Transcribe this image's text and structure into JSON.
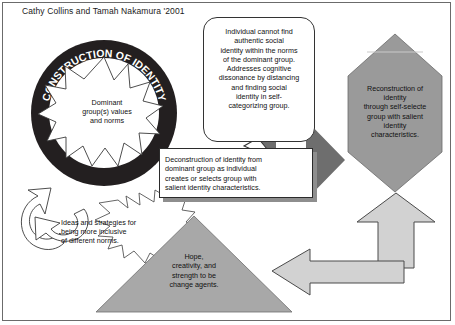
{
  "diagram": {
    "title": "Cathy Collins and Tamah Nakamura '2001",
    "ring_label": "CONSTRUCTION OF IDENTITY",
    "starburst": {
      "line1": "Dominant",
      "line2": "group(s) values",
      "line3": "and norms"
    },
    "callout": {
      "text": "Individual cannot find authentic social identity within the norms of the dominant group. Addresses cognitive dissonance by distancing and finding social identity in self-categorizing group.",
      "lines": [
        "Individual cannot find",
        "authentic social",
        "identity within the norms",
        "of the dominant group.",
        "Addresses cognitive",
        "dissonance by distancing",
        "and finding social",
        "identity in self-",
        "categorizing group."
      ]
    },
    "deconstruction_box": {
      "text": "Deconstruction of identity from dominant group as individual creates or selects group with salient identity characteristics.",
      "lines": [
        "Deconstruction of identity from",
        "dominant group as individual",
        "creates or selects group with",
        "salient identity characteristics."
      ]
    },
    "hexagon": {
      "text": "Reconstruction of identity through self-selecte group with salient identity characteristics.",
      "lines": [
        "Reconstruction of",
        "identity",
        "through self-selecte",
        "group with salient",
        "identity",
        "characteristics."
      ]
    },
    "triangle": {
      "text": "Hope, creativity, and strength to be change agents.",
      "lines": [
        "Hope,",
        "creativity, and",
        "strength to be",
        "change agents."
      ]
    },
    "ideas_burst": {
      "text": "Ideas and strategies for being more inclusive of different norms.",
      "lines": [
        "Ideas and strategies for",
        "being more inclusive",
        "of different norms."
      ]
    },
    "colors": {
      "ring_fill": "#231f20",
      "hexagon_fill": "#9a9a9a",
      "triangle_fill": "#a8a8a8",
      "dark_arrow": "#6e6e6e",
      "light_arrow": "#d2d2d2",
      "frame_border": "#6b6b6b",
      "shadow": "#8e8e8e",
      "text": "#111111"
    }
  }
}
